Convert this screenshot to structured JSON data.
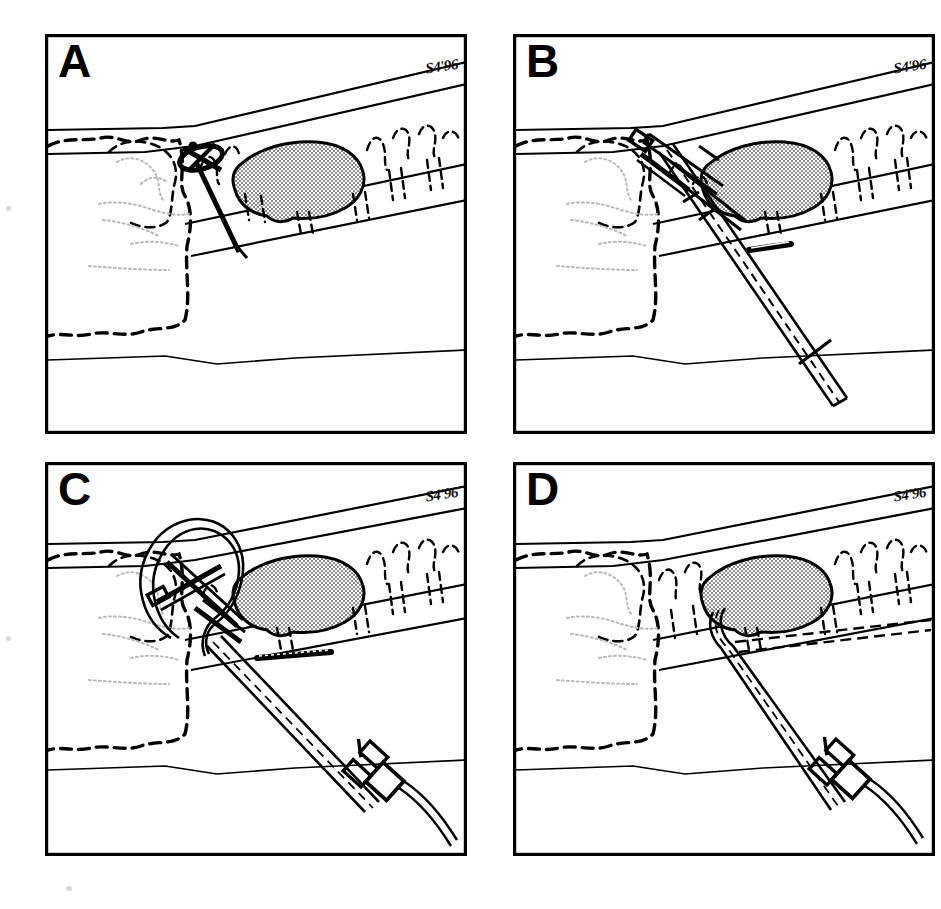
{
  "figure": {
    "background_color": "#ffffff",
    "ink_color": "#000000",
    "shaded_organ_color": "#b8b8b8",
    "panel_count": 4
  },
  "panels": [
    {
      "letter": "A",
      "signature": "S4'96",
      "caption_step": "Needle puncture through the tissue wall toward the target",
      "instruments": [
        "puncture-needle",
        "needle-hub"
      ],
      "anatomy": [
        "outer-wall-band",
        "inner-wall-band",
        "dashed-organ-outline",
        "shaded-mass",
        "mucosal-folds",
        "faint-internal-detail"
      ]
    },
    {
      "letter": "B",
      "signature": "S4'96",
      "caption_step": "Guidewire advanced through the needle and cannula assembly",
      "instruments": [
        "puncture-needle",
        "outer-cannula",
        "guidewire",
        "wire-stop-marker"
      ],
      "anatomy": [
        "outer-wall-band",
        "inner-wall-band",
        "dashed-organ-outline",
        "shaded-mass",
        "mucosal-folds",
        "faint-internal-detail"
      ]
    },
    {
      "letter": "C",
      "signature": "S4'96",
      "caption_step": "Wire loop formed; catheter advanced over the wire with luer hub attached",
      "instruments": [
        "guidewire-loop",
        "catheter",
        "luer-hub",
        "connector-tubing",
        "needle-assembly"
      ],
      "anatomy": [
        "outer-wall-band",
        "inner-wall-band",
        "dashed-organ-outline",
        "shaded-mass",
        "mucosal-folds",
        "faint-internal-detail"
      ]
    },
    {
      "letter": "D",
      "signature": "S4'96",
      "caption_step": "Needle withdrawn; catheter tip seated and tracking along the duct",
      "instruments": [
        "catheter",
        "luer-hub",
        "connector-tubing",
        "indwelling-catheter-tip"
      ],
      "anatomy": [
        "outer-wall-band",
        "inner-wall-band",
        "dashed-organ-outline",
        "shaded-mass",
        "mucosal-folds",
        "faint-internal-detail"
      ]
    }
  ]
}
